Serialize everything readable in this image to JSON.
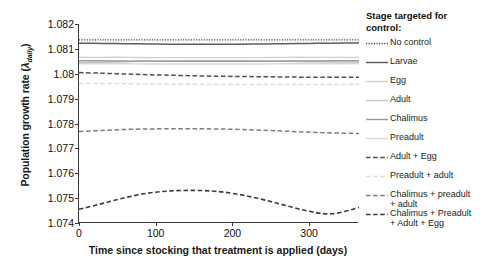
{
  "chart_data": {
    "type": "line",
    "title": "",
    "xlabel": "Time since stocking that treatment is applied (days)",
    "ylabel": "Population growth rate (λ daily)",
    "ylabel_main": "Population growth rate (",
    "ylabel_symbol": "λ",
    "ylabel_sub": "daily",
    "ylabel_close": ")",
    "xlim": [
      0,
      365
    ],
    "ylim": [
      1.074,
      1.082
    ],
    "yticks": [
      "1.074",
      "1.075",
      "1.076",
      "1.077",
      "1.078",
      "1.079",
      "1.08",
      "1.081",
      "1.082"
    ],
    "ytick_values": [
      1.074,
      1.075,
      1.076,
      1.077,
      1.078,
      1.079,
      1.08,
      1.081,
      1.082
    ],
    "xticks": [
      "0",
      "100",
      "200",
      "300"
    ],
    "xtick_values": [
      0,
      100,
      200,
      300
    ],
    "grid": false,
    "legend_position": "right",
    "legend_title": "Stage targeted for control:",
    "x": [
      0,
      30,
      60,
      90,
      120,
      150,
      180,
      210,
      240,
      270,
      300,
      330,
      365
    ],
    "series": [
      {
        "name": "No control",
        "style": "dotted",
        "color": "#4a4a4a",
        "width": 1.3,
        "values": [
          1.08136,
          1.08136,
          1.08136,
          1.08136,
          1.08136,
          1.08136,
          1.08136,
          1.08136,
          1.08136,
          1.08136,
          1.08136,
          1.08136,
          1.08136
        ]
      },
      {
        "name": "Larvae",
        "style": "solid",
        "color": "#5e5e5e",
        "width": 1.5,
        "values": [
          1.08123,
          1.08122,
          1.08121,
          1.0812,
          1.08119,
          1.08119,
          1.08119,
          1.08119,
          1.0812,
          1.08121,
          1.08122,
          1.08123,
          1.08124
        ]
      },
      {
        "name": "Egg",
        "style": "solid",
        "color": "#cfcfcf",
        "width": 1.4,
        "values": [
          1.08066,
          1.08066,
          1.08066,
          1.08065,
          1.08065,
          1.08065,
          1.08065,
          1.08065,
          1.08065,
          1.08066,
          1.08066,
          1.08066,
          1.08066
        ]
      },
      {
        "name": "Adult",
        "style": "solid",
        "color": "#c4c4c4",
        "width": 1.4,
        "values": [
          1.08044,
          1.08046,
          1.08048,
          1.0805,
          1.08051,
          1.08052,
          1.08052,
          1.08052,
          1.08051,
          1.0805,
          1.08048,
          1.08047,
          1.08046
        ]
      },
      {
        "name": "Chalimus",
        "style": "solid",
        "color": "#9a9a9a",
        "width": 1.4,
        "values": [
          1.08052,
          1.08052,
          1.08051,
          1.08051,
          1.0805,
          1.0805,
          1.0805,
          1.0805,
          1.0805,
          1.08051,
          1.08051,
          1.08052,
          1.08052
        ]
      },
      {
        "name": "Preadult",
        "style": "solid",
        "color": "#d8d8d8",
        "width": 1.4,
        "values": [
          1.0804,
          1.0804,
          1.0804,
          1.08039,
          1.08039,
          1.08039,
          1.08039,
          1.08039,
          1.08039,
          1.0804,
          1.0804,
          1.0804,
          1.08041
        ]
      },
      {
        "name": "Adult + Egg",
        "style": "dashed",
        "color": "#4f4f4f",
        "width": 1.5,
        "values": [
          1.08005,
          1.08002,
          1.07999,
          1.07996,
          1.07994,
          1.07992,
          1.0799,
          1.07989,
          1.07988,
          1.07987,
          1.07986,
          1.07986,
          1.07986
        ]
      },
      {
        "name": "Preadult + adult",
        "style": "dashed",
        "color": "#dcdcdc",
        "width": 1.4,
        "values": [
          1.07962,
          1.07961,
          1.0796,
          1.07959,
          1.07958,
          1.07958,
          1.07957,
          1.07957,
          1.07957,
          1.07957,
          1.07957,
          1.07957,
          1.07958
        ]
      },
      {
        "name": "Chalimus + preadult + adult",
        "style": "dashed",
        "color": "#7d7d7d",
        "width": 1.5,
        "values": [
          1.07768,
          1.07772,
          1.07776,
          1.07778,
          1.07779,
          1.07779,
          1.07778,
          1.07776,
          1.07773,
          1.07769,
          1.07765,
          1.07762,
          1.0776
        ]
      },
      {
        "name": "Chalimus + Preadult + Adult + Egg",
        "style": "dashed",
        "color": "#3c3c3c",
        "width": 1.6,
        "values": [
          1.07455,
          1.07478,
          1.07502,
          1.0752,
          1.07529,
          1.07531,
          1.07527,
          1.07514,
          1.07494,
          1.0747,
          1.07447,
          1.07437,
          1.07462
        ]
      }
    ]
  },
  "legend": {
    "title": "Stage targeted for control:",
    "items": [
      {
        "label": "No control"
      },
      {
        "label": "Larvae"
      },
      {
        "label": "Egg"
      },
      {
        "label": "Adult"
      },
      {
        "label": "Chalimus"
      },
      {
        "label": "Preadult"
      },
      {
        "label": "Adult + Egg"
      },
      {
        "label": "Preadult + adult"
      },
      {
        "label": "Chalimus + preadult\n+ adult"
      },
      {
        "label": "Chalimus + Preadult\n+ Adult + Egg"
      }
    ]
  }
}
